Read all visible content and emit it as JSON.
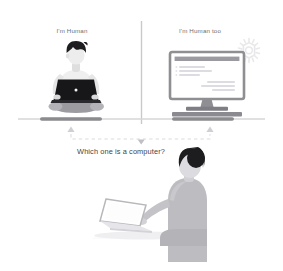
{
  "illustration": {
    "title": "Which one is a computer?",
    "background_color": "#ffffff",
    "panels": {
      "left": {
        "label": "I'm Human",
        "subject": "person-sitting-cross-legged-with-laptop"
      },
      "right": {
        "label": "I'm Human too",
        "subject": "desktop-monitor-with-chat-messages"
      }
    },
    "bottom": {
      "question": "Which one is a computer?",
      "subject": "person-back-view-at-desk-with-laptop"
    },
    "colors": {
      "text_label": "#6f6f72",
      "text_question": "#3f3f43",
      "divider": "#c9c9cd",
      "ground_line": "#d4d4d8",
      "shadow_bar": "#8a8a8f",
      "figure_body": "#b9b9bd",
      "figure_skin": "#e9e9ea",
      "hair_dark": "#1d1d20",
      "laptop_dark": "#17171a",
      "monitor_frame": "#8e8e93",
      "chip_icon": "#e3e3e6",
      "arrow": "#d0d0d4",
      "dashed": "#dcdce0"
    }
  }
}
